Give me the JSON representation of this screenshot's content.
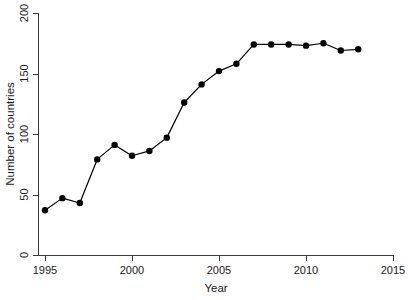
{
  "chart_data": {
    "type": "line",
    "title": "",
    "subtitle": "",
    "xlabel": "Year",
    "ylabel": "Number of countries",
    "x": [
      1995,
      1996,
      1997,
      1998,
      1999,
      2000,
      2001,
      2002,
      2003,
      2004,
      2005,
      2006,
      2007,
      2008,
      2009,
      2010,
      2011,
      2012,
      2013
    ],
    "values": [
      37,
      47,
      43,
      79,
      91,
      82,
      86,
      97,
      126,
      141,
      152,
      158,
      174,
      174,
      174,
      173,
      175,
      169,
      170
    ],
    "series": [
      {
        "name": "Number of countries",
        "values": [
          37,
          47,
          43,
          79,
          91,
          82,
          86,
          97,
          126,
          141,
          152,
          158,
          174,
          174,
          174,
          173,
          175,
          169,
          170
        ]
      }
    ],
    "xlim": [
      1994.5,
      2015
    ],
    "ylim": [
      0,
      200
    ],
    "xticks": [
      1995,
      2000,
      2005,
      2010,
      2015
    ],
    "xticklabels": [
      "1995",
      "2000",
      "2005",
      "2010",
      "2015"
    ],
    "yticks": [
      0,
      50,
      100,
      150,
      200
    ],
    "yticklabels": [
      "0",
      "50",
      "100",
      "150",
      "200"
    ],
    "grid": false,
    "legend": false,
    "legend_position": "none",
    "marker": "filled-circle",
    "line_color": "#000000",
    "marker_color": "#000000",
    "background_color": "#ffffff",
    "annotations": []
  }
}
